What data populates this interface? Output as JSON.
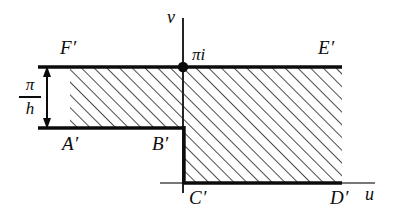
{
  "figure": {
    "type": "complex-plane-region-diagram",
    "background_color": "#ffffff",
    "line_color": "#0b0b0b",
    "hatch_color": "#2b2b2b",
    "axes": {
      "vertical_label": "v",
      "horizontal_label": "u"
    },
    "marked_point": {
      "label": "πi",
      "style": "filled-dot"
    },
    "dimension": {
      "numerator": "π",
      "denominator": "h"
    },
    "boundary_points": [
      {
        "id": "F",
        "label": "F′"
      },
      {
        "id": "E",
        "label": "E′"
      },
      {
        "id": "A",
        "label": "A′"
      },
      {
        "id": "B",
        "label": "B′"
      },
      {
        "id": "C",
        "label": "C′"
      },
      {
        "id": "D",
        "label": "D′"
      }
    ]
  }
}
